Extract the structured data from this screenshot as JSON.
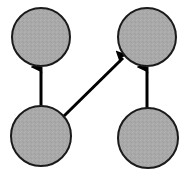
{
  "figure": {
    "width": 188,
    "height": 176,
    "background_color": "#ffffff"
  },
  "style": {
    "node_fill": "#a9a9a9",
    "node_stroke": "#1a1a1a",
    "node_stroke_width": 2,
    "edge_color": "#000000",
    "edge_width": 3,
    "arrowhead_color": "#000000"
  },
  "chart_data": {
    "type": "diagram",
    "nodes": [
      {
        "id": "top-left",
        "label": "",
        "cx": 41,
        "cy": 37,
        "r": 29,
        "fill": "#a9a9a9",
        "stroke": "#1a1a1a"
      },
      {
        "id": "top-right",
        "label": "",
        "cx": 147,
        "cy": 37,
        "r": 29,
        "fill": "#a9a9a9",
        "stroke": "#1a1a1a"
      },
      {
        "id": "bottom-left",
        "label": "",
        "cx": 41,
        "cy": 136,
        "r": 30,
        "fill": "#a9a9a9",
        "stroke": "#1a1a1a"
      },
      {
        "id": "bottom-right",
        "label": "",
        "cx": 148,
        "cy": 138,
        "r": 30,
        "fill": "#a9a9a9",
        "stroke": "#1a1a1a"
      }
    ],
    "edges": [
      {
        "id": "edge-bl-tl",
        "from": "bottom-left",
        "to": "top-left",
        "label": "",
        "directed": true,
        "x1": 41,
        "y1": 106,
        "x2": 41,
        "y2": 67
      },
      {
        "id": "edge-bl-tr",
        "from": "bottom-left",
        "to": "top-right",
        "label": "",
        "directed": true,
        "x1": 64,
        "y1": 116,
        "x2": 123,
        "y2": 58
      },
      {
        "id": "edge-br-tr",
        "from": "bottom-right",
        "to": "top-right",
        "label": "",
        "directed": true,
        "x1": 147,
        "y1": 108,
        "x2": 147,
        "y2": 67
      }
    ],
    "legend": [],
    "annotations": []
  }
}
